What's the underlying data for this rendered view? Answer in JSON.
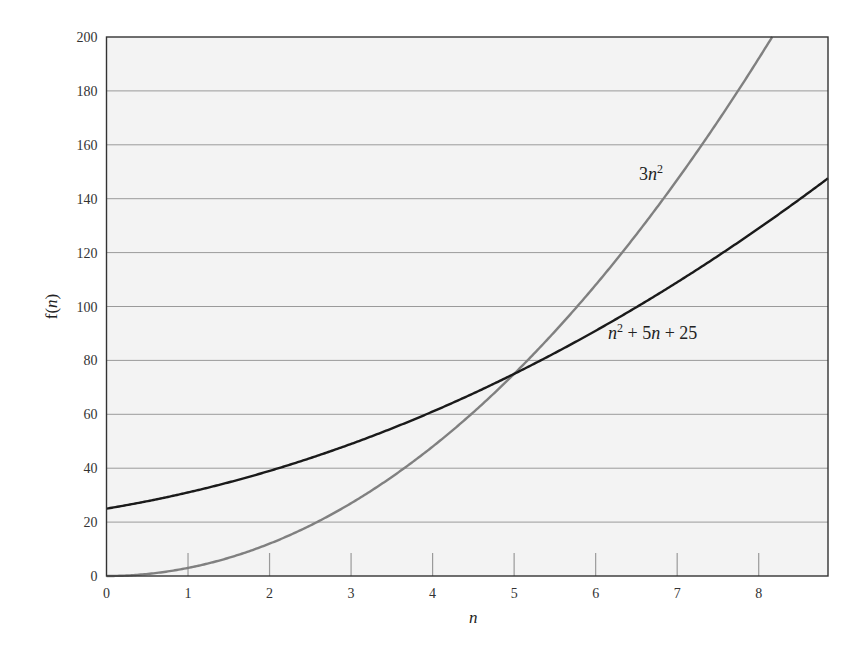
{
  "chart_data": {
    "type": "line",
    "title": "",
    "xlabel": "n",
    "ylabel": "f(n)",
    "xlim": [
      0,
      8.85
    ],
    "ylim": [
      0,
      200
    ],
    "x_ticks": [
      0,
      1,
      2,
      3,
      4,
      5,
      6,
      7,
      8
    ],
    "y_ticks": [
      0,
      20,
      40,
      60,
      80,
      100,
      120,
      140,
      160,
      180,
      200
    ],
    "grid": {
      "horizontal": true,
      "vertical": false
    },
    "legend": null,
    "series": [
      {
        "name": "3n^2",
        "label_text": [
          "3",
          "n",
          "2"
        ],
        "color": "#808080",
        "formula": "3*n*n",
        "x": [
          0,
          1,
          2,
          3,
          4,
          5,
          6,
          7,
          8,
          8.16
        ],
        "values": [
          0,
          3,
          12,
          27,
          48,
          75,
          108,
          147,
          192,
          200
        ]
      },
      {
        "name": "n^2 + 5n + 25",
        "label_text": [
          "n",
          "2",
          " + 5",
          "n",
          " + 25"
        ],
        "color": "#1a1a1a",
        "formula": "n*n + 5*n + 25",
        "x": [
          0,
          1,
          2,
          3,
          4,
          5,
          6,
          7,
          8,
          8.85
        ],
        "values": [
          25,
          31,
          39,
          49,
          61,
          75,
          91,
          109,
          129,
          147.6
        ]
      }
    ],
    "annotations": [
      {
        "text": "3n^2",
        "x": 6.3,
        "y": 143
      },
      {
        "text": "n^2 + 5n + 25",
        "x": 6.2,
        "y": 86
      }
    ],
    "intersection": {
      "x": 5,
      "y": 75
    }
  },
  "colors": {
    "plot_background": "#f3f3f3",
    "grid": "#9a9a9a",
    "axis": "#333333",
    "curve_quadratic": "#808080",
    "curve_polynomial": "#1a1a1a"
  }
}
